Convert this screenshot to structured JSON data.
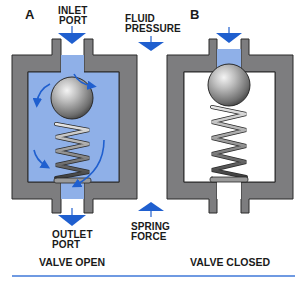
{
  "colors": {
    "body_gray": "#7d7d7f",
    "body_outline": "#2b2b2b",
    "fluid_blue": "#8fb0e8",
    "arrow_blue": "#1f5fcf",
    "separator_blue": "#3f78d8",
    "text": "#1a1a1a"
  },
  "panel_a": {
    "letter": "A",
    "inlet_label_line1": "INLET",
    "inlet_label_line2": "PORT",
    "outlet_label_line1": "OUTLET",
    "outlet_label_line2": "PORT",
    "caption": "VALVE OPEN"
  },
  "panel_b": {
    "letter": "B",
    "caption": "VALVE CLOSED"
  },
  "center": {
    "fluid_label_line1": "FLUID",
    "fluid_label_line2": "PRESSURE",
    "spring_label_line1": "SPRING",
    "spring_label_line2": "FORCE"
  },
  "icons": {
    "inlet_arrow": "arrow-down-icon",
    "outlet_arrow": "arrow-down-icon",
    "fluid_pressure_arrow": "arrow-down-icon",
    "spring_force_arrow": "arrow-up-icon",
    "flow_arrows": "curved-flow-arrow-icon"
  }
}
